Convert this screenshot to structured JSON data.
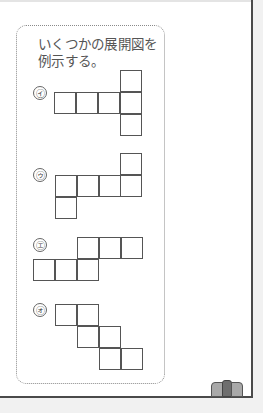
{
  "note": {
    "line1": "いくつかの展開図を",
    "line2": "例示する。"
  },
  "nets": [
    {
      "label": "㋑",
      "name": "net-i"
    },
    {
      "label": "㋒",
      "name": "net-u"
    },
    {
      "label": "㋓",
      "name": "net-e"
    },
    {
      "label": "㋔",
      "name": "net-o"
    }
  ],
  "icons": {
    "book": "book-icon"
  },
  "colors": {
    "line": "#555555",
    "border": "#4a4a4a",
    "book_light": "#a9a9a9",
    "book_dark": "#6e6e6e"
  }
}
